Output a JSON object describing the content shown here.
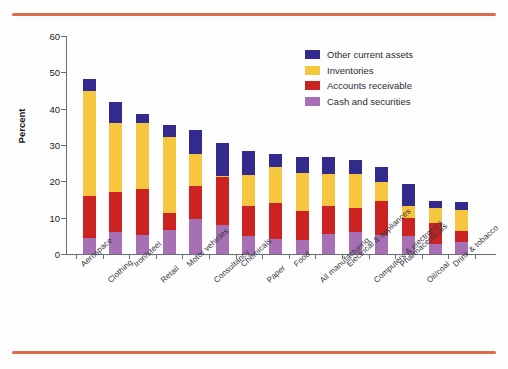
{
  "figure": {
    "background_color": "#fdfdfe",
    "rule_color": "#dd6a48",
    "axis_color": "#6d6d78"
  },
  "legend": {
    "position": "top-right-inside",
    "items": [
      {
        "label": "Other current assets",
        "color": "#332a8e",
        "key": "other"
      },
      {
        "label": "Inventories",
        "color": "#f7c63f",
        "key": "inventories"
      },
      {
        "label": "Accounts receivable",
        "color": "#cd2222",
        "key": "receivable"
      },
      {
        "label": "Cash and securities",
        "color": "#a770b4",
        "key": "cash"
      }
    ]
  },
  "chart_data": {
    "type": "bar",
    "stacked": true,
    "title": "",
    "xlabel": "",
    "ylabel": "Percent",
    "ylim": [
      0,
      60
    ],
    "yticks": [
      0,
      10,
      20,
      30,
      40,
      50,
      60
    ],
    "ytick_labels": [
      "0",
      "10",
      "20",
      "30",
      "40",
      "50",
      "60"
    ],
    "grid": false,
    "legend_position": "upper right",
    "categories": [
      "Aerospace",
      "Clothing",
      "Iron/steel",
      "Retail",
      "Motor vehicles",
      "Consultancy",
      "Chemicals",
      "Paper",
      "Food",
      "All manufacturing",
      "Electrical & appliances",
      "Computers & electronics",
      "Pharmaceuticals",
      "Oil/coal",
      "Drink & tobacco"
    ],
    "series": [
      {
        "name": "Cash and securities",
        "color": "#a770b4",
        "values": [
          4.5,
          6.0,
          5.3,
          6.6,
          9.5,
          8.1,
          5.0,
          4.0,
          3.8,
          5.6,
          6.0,
          5.2,
          5.0,
          2.7,
          3.4
        ]
      },
      {
        "name": "Accounts receivable",
        "color": "#cd2222",
        "values": [
          11.4,
          11.0,
          12.6,
          4.7,
          9.2,
          13.0,
          8.3,
          10.0,
          8.0,
          7.6,
          6.6,
          9.3,
          5.0,
          5.8,
          2.8
        ]
      },
      {
        "name": "Inventories",
        "color": "#f7c63f",
        "values": [
          29.1,
          19.0,
          18.2,
          20.8,
          8.7,
          0.4,
          8.5,
          10.0,
          10.5,
          8.8,
          9.4,
          5.2,
          3.2,
          4.3,
          5.8
        ]
      },
      {
        "name": "Other current assets",
        "color": "#332a8e",
        "values": [
          3.1,
          5.8,
          2.4,
          3.4,
          6.6,
          9.0,
          6.5,
          3.6,
          4.5,
          4.7,
          4.0,
          4.3,
          6.0,
          1.9,
          2.3
        ]
      }
    ],
    "totals": [
      48.1,
      41.8,
      38.5,
      35.5,
      34.0,
      30.5,
      28.3,
      27.6,
      26.8,
      26.7,
      26.0,
      24.0,
      19.2,
      14.7,
      14.3
    ]
  }
}
